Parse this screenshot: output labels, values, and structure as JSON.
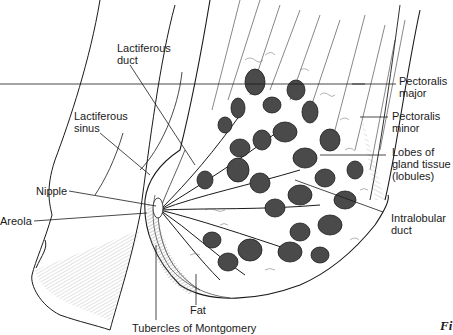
{
  "diagram": {
    "labels": [
      {
        "id": "lactiferous-duct",
        "text": "Lactiferous\nduct"
      },
      {
        "id": "lactiferous-sinus",
        "text": "Lactiferous\nsinus"
      },
      {
        "id": "nipple",
        "text": "Nipple"
      },
      {
        "id": "areola",
        "text": "Areola"
      },
      {
        "id": "pectoralis-major",
        "text": "Pectoralis\nmajor"
      },
      {
        "id": "pectoralis-minor",
        "text": "Pectoralis\nminor"
      },
      {
        "id": "lobes",
        "text": "Lobes of\ngland tissue\n(lobules)"
      },
      {
        "id": "intralobular-duct",
        "text": "Intralobular\nduct"
      },
      {
        "id": "fat",
        "text": "Fat"
      },
      {
        "id": "tubercles",
        "text": "Tubercles of Montgomery"
      }
    ],
    "figure_caption_fragment": "Fi"
  },
  "colors": {
    "line": "#1a1a1a",
    "lobule_fill": "#4a4a4a",
    "hatch": "#888888",
    "background": "#ffffff"
  }
}
